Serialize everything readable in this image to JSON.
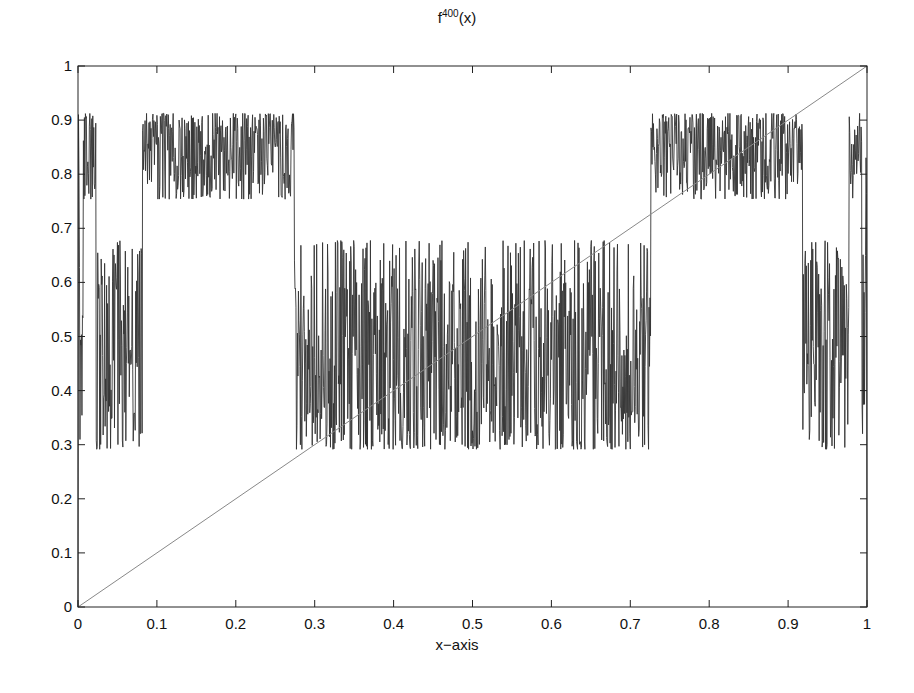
{
  "chart_data": {
    "type": "line",
    "title_base": "f",
    "title_sup": "400",
    "title_suffix": "(x)",
    "xlabel": "x−axis",
    "ylabel": "",
    "xlim": [
      0,
      1
    ],
    "ylim": [
      0,
      1
    ],
    "xticks": [
      "0",
      "0.1",
      "0.2",
      "0.3",
      "0.4",
      "0.5",
      "0.6",
      "0.7",
      "0.8",
      "0.9",
      "1"
    ],
    "yticks": [
      "0",
      "0.1",
      "0.2",
      "0.3",
      "0.4",
      "0.5",
      "0.6",
      "0.7",
      "0.8",
      "0.9",
      "1"
    ],
    "grid": false,
    "legend": null,
    "series": [
      {
        "name": "f^400(x)",
        "description": "400th iterate of logistic map f(x)=r x (1-x); chaotic, two bands",
        "map": "logistic",
        "r": 3.65,
        "iterations": 400,
        "samples": 1600,
        "color": "#333333",
        "bands": [
          [
            0.76,
            0.912
          ],
          [
            0.29,
            0.675
          ]
        ],
        "band_segments_x": [
          {
            "x": [
              0.0,
              0.02
            ],
            "band": "upper"
          },
          {
            "x": [
              0.02,
              0.083
            ],
            "band": "lower"
          },
          {
            "x": [
              0.083,
              0.275
            ],
            "band": "upper"
          },
          {
            "x": [
              0.275,
              0.725
            ],
            "band": "lower"
          },
          {
            "x": [
              0.725,
              0.917
            ],
            "band": "upper"
          },
          {
            "x": [
              0.917,
              0.98
            ],
            "band": "lower"
          },
          {
            "x": [
              0.98,
              1.0
            ],
            "band": "upper"
          }
        ]
      },
      {
        "name": "y = x",
        "x": [
          0,
          1
        ],
        "y": [
          0,
          1
        ],
        "color": "#888888"
      }
    ]
  }
}
